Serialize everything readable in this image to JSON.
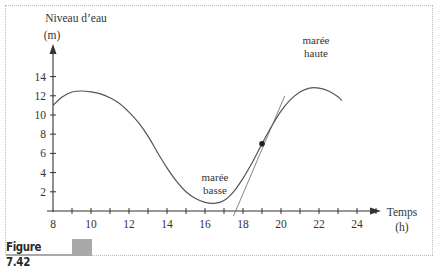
{
  "figure": {
    "caption": "Figure 7.42"
  },
  "axes": {
    "ylabel_line1": "Niveau d’eau",
    "ylabel_line2": "(m)",
    "xlabel_line1": "Temps",
    "xlabel_line2": "(h)"
  },
  "annotations": {
    "low_tide_line1": "marée",
    "low_tide_line2": "basse",
    "high_tide_line1": "marée",
    "high_tide_line2": "haute"
  },
  "colors": {
    "curve": "#555555",
    "axis": "#333333",
    "text": "#333333",
    "caption_block": "#a9a9a9"
  },
  "chart_data": {
    "type": "line",
    "title": "",
    "xlabel": "Temps (h)",
    "ylabel": "Niveau d’eau (m)",
    "xlim": [
      8,
      25
    ],
    "ylim": [
      0,
      15
    ],
    "x_ticks": [
      8,
      10,
      12,
      14,
      16,
      18,
      20,
      22,
      24
    ],
    "y_ticks": [
      2,
      4,
      6,
      8,
      10,
      12,
      14
    ],
    "grid": false,
    "series": [
      {
        "name": "Niveau d’eau",
        "x": [
          8,
          8.5,
          9,
          9.5,
          10,
          10.5,
          11,
          11.5,
          12,
          12.5,
          13,
          13.5,
          14,
          14.5,
          15,
          15.5,
          16,
          16.5,
          17,
          17.5,
          18,
          18.5,
          19,
          19.5,
          20,
          20.5,
          21,
          21.5,
          22,
          22.5,
          23,
          23.2
        ],
        "y": [
          11.0,
          11.9,
          12.4,
          12.5,
          12.4,
          12.2,
          11.8,
          11.2,
          10.3,
          9.2,
          7.8,
          6.1,
          4.5,
          3.1,
          2.0,
          1.3,
          0.9,
          0.8,
          1.1,
          2.0,
          3.4,
          5.1,
          7.0,
          8.8,
          10.4,
          11.6,
          12.4,
          12.8,
          12.8,
          12.5,
          11.9,
          11.5
        ]
      }
    ],
    "point": {
      "x": 19,
      "y": 7.0
    },
    "tangent_line": {
      "x": [
        17.5,
        20.2
      ],
      "y": [
        0,
        12.0
      ]
    },
    "annotations": [
      {
        "text": "marée basse",
        "x": 16.5,
        "y": 2.5
      },
      {
        "text": "marée haute",
        "x": 22,
        "y": 15
      }
    ]
  }
}
